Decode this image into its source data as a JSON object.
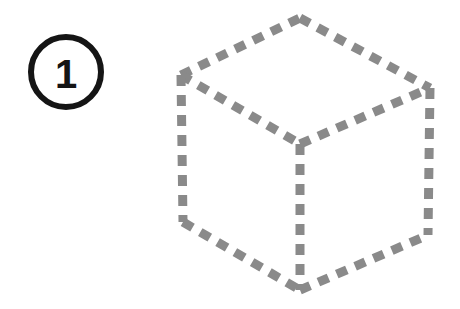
{
  "figure": {
    "title": "Step 1 isometric cube illustration",
    "background_color": "#ffffff",
    "width": 460,
    "height": 309
  },
  "step_marker": {
    "label": "1",
    "shape": "circle",
    "center_x": 66,
    "center_y": 72,
    "radius": 35,
    "stroke_color": "#151515",
    "stroke_width": 6,
    "fill_color": "#ffffff",
    "text_color": "#151515"
  },
  "cube": {
    "name": "isometric-cube",
    "stroke_color": "#8a8a8a",
    "stroke_width": 9,
    "dash_pattern": "11 9",
    "line_cap": "butt",
    "vertices": {
      "top": {
        "x": 300,
        "y": 18
      },
      "left": {
        "x": 181,
        "y": 75
      },
      "right": {
        "x": 430,
        "y": 88
      },
      "center": {
        "x": 300,
        "y": 144
      },
      "bottom_left": {
        "x": 183,
        "y": 222
      },
      "bottom_right": {
        "x": 428,
        "y": 235
      },
      "bottom": {
        "x": 300,
        "y": 290
      }
    },
    "edges": [
      {
        "name": "top-face-upper-left",
        "from": "left",
        "to": "top"
      },
      {
        "name": "top-face-upper-right",
        "from": "top",
        "to": "right"
      },
      {
        "name": "top-face-lower-left",
        "from": "left",
        "to": "center"
      },
      {
        "name": "top-face-lower-right",
        "from": "center",
        "to": "right"
      },
      {
        "name": "left-vertical",
        "from": "left",
        "to": "bottom_left"
      },
      {
        "name": "right-vertical",
        "from": "right",
        "to": "bottom_right"
      },
      {
        "name": "front-vertical",
        "from": "center",
        "to": "bottom"
      },
      {
        "name": "bottom-left-edge",
        "from": "bottom_left",
        "to": "bottom"
      },
      {
        "name": "bottom-right-edge",
        "from": "bottom",
        "to": "bottom_right"
      }
    ]
  }
}
